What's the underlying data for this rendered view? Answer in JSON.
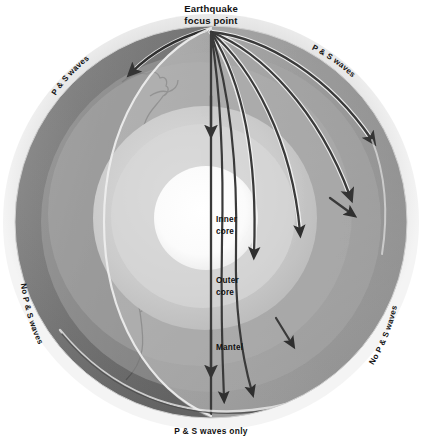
{
  "figure": {
    "background_color": "#ffffff"
  },
  "labels": {
    "focus": {
      "line1": "Earthquake",
      "line2": "focus point"
    },
    "layers": {
      "inner_core_line1": "Inner",
      "inner_core_line2": "core",
      "outer_core_line1": "Outer",
      "outer_core_line2": "core",
      "mantle": "Mantel"
    },
    "zones": {
      "upper_left": "P & S waves",
      "upper_right": "P & S waves",
      "lower_left": "No P & S waves",
      "lower_right": "No P & S waves",
      "bottom": "P & S waves only"
    }
  },
  "colors": {
    "background": "#ffffff",
    "halo": "#e8e8e8",
    "crust_dark": "#6f6f6f",
    "continent_outline": "#4a4a4a",
    "mantle_light": "#b9b9b9",
    "mantle_mid": "#a6a6a6",
    "mantle_dark": "#8e8e8e",
    "outer_core": "#cfcfcf",
    "inner_core": "#ffffff",
    "ray": "#3c3c3c",
    "ray_highlight": "#f2f2f2",
    "label_text": "#111111"
  },
  "geometry": {
    "center_x": 211,
    "center_y": 222,
    "globe_radius": 196,
    "halo_radius": 208,
    "mantle_radius": 170,
    "outer_core_radius": 112,
    "inner_core_radius": 52,
    "focus_x": 211,
    "focus_y": 32
  },
  "rays": {
    "count_right_fan": 6,
    "vertical_ray": true,
    "description": "Seismic P and S wave paths radiating from the focus point, refracting at the outer core boundary"
  }
}
